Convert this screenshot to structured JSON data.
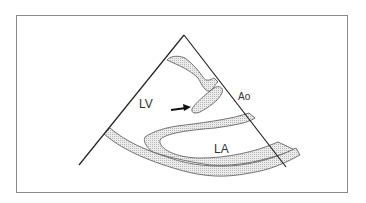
{
  "diagram": {
    "type": "echocardiogram-schematic",
    "view": "parasternal long axis sector",
    "labels": {
      "lv": "LV",
      "ao": "Ao",
      "la": "LA"
    },
    "annotations": {
      "arrow": "arrow pointing to structure in LV outflow"
    },
    "colors": {
      "outline": "#222222",
      "tissue_fill": "#d9d9d9",
      "frame": "#8a8a8a",
      "background": "#ffffff"
    }
  }
}
